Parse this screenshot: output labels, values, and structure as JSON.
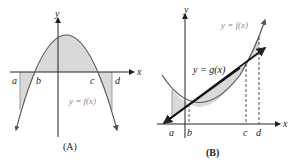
{
  "panel_a": {
    "caption": "(A)",
    "axis_x_label": "x",
    "axis_y_label": "y",
    "points": [
      "a",
      "b",
      "c",
      "d"
    ],
    "curve_label": "y = f(x)"
  },
  "panel_b": {
    "caption": "(B)",
    "axis_x_label": "x",
    "axis_y_label": "y",
    "points": [
      "a",
      "b",
      "c",
      "d"
    ],
    "curve_f_label": "y = f(x)",
    "curve_g_label": "y = g(x)"
  },
  "colors": {
    "shade": "#d9d9d9",
    "curve": "#555555",
    "axis": "#222222",
    "line": "#111111",
    "muted_label": "#888888"
  }
}
